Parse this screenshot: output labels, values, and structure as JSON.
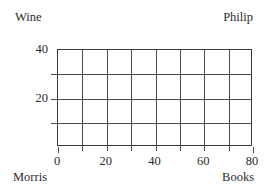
{
  "corners": {
    "top_left": "Wine",
    "top_right": "Philip",
    "bottom_left": "Morris",
    "bottom_right": "Books"
  },
  "colors": {
    "background": "#ffffff",
    "frame": "#3a3a3a",
    "grid": "#4a4a4a",
    "text": "#2b2b2b"
  },
  "chart_data": {
    "type": "table",
    "title": "",
    "subtitle": "",
    "xlabel": "",
    "ylabel": "",
    "xlim": [
      0,
      80
    ],
    "ylim": [
      0,
      40
    ],
    "grid": true,
    "legend": null,
    "x_ticks": [
      0,
      20,
      40,
      60,
      80
    ],
    "x_tick_labels": [
      "0",
      "20",
      "40",
      "60",
      "80"
    ],
    "y_ticks": [
      20,
      40
    ],
    "y_tick_labels": [
      "20",
      "40"
    ],
    "x_minor_step": 10,
    "y_minor_step": 10,
    "grid_columns": 8,
    "grid_rows": 4,
    "series": [],
    "values": [],
    "categories": [],
    "annotations": [
      {
        "position": "top-left",
        "text": "Wine"
      },
      {
        "position": "top-right",
        "text": "Philip"
      },
      {
        "position": "bottom-left",
        "text": "Morris"
      },
      {
        "position": "bottom-right",
        "text": "Books"
      }
    ]
  }
}
